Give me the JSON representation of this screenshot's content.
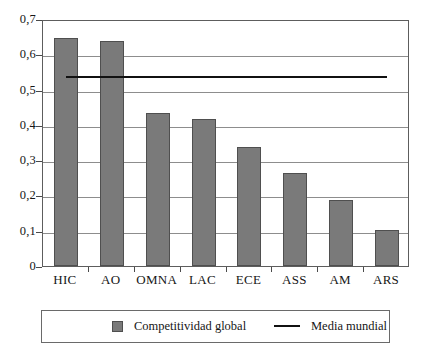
{
  "chart_data": {
    "type": "bar",
    "title": "",
    "xlabel": "",
    "ylabel": "",
    "categories": [
      "HIC",
      "AO",
      "OMNA",
      "LAC",
      "ECE",
      "ASS",
      "AM",
      "ARS"
    ],
    "series": [
      {
        "name": "Competitividad global",
        "type": "bar",
        "color": "#7a7a7a",
        "values": [
          0.645,
          0.638,
          0.435,
          0.418,
          0.338,
          0.263,
          0.188,
          0.102
        ]
      },
      {
        "name": "Media mundial",
        "type": "reference-line",
        "color": "#111111",
        "value": 0.54
      }
    ],
    "ylim": [
      0,
      0.7
    ],
    "ytick_values": [
      0,
      0.1,
      0.2,
      0.3,
      0.4,
      0.5,
      0.6,
      0.7
    ],
    "ytick_labels": [
      "0",
      "0,1",
      "0,2",
      "0,3",
      "0,4",
      "0,5",
      "0,6",
      "0,7"
    ],
    "grid": true,
    "grid_axis": "y",
    "legend_position": "bottom",
    "decimal_separator": ","
  },
  "legend": {
    "entries": [
      {
        "label": "Competitividad global",
        "marker": "square-swatch"
      },
      {
        "label": "Media mundial",
        "marker": "line-swatch"
      }
    ]
  }
}
